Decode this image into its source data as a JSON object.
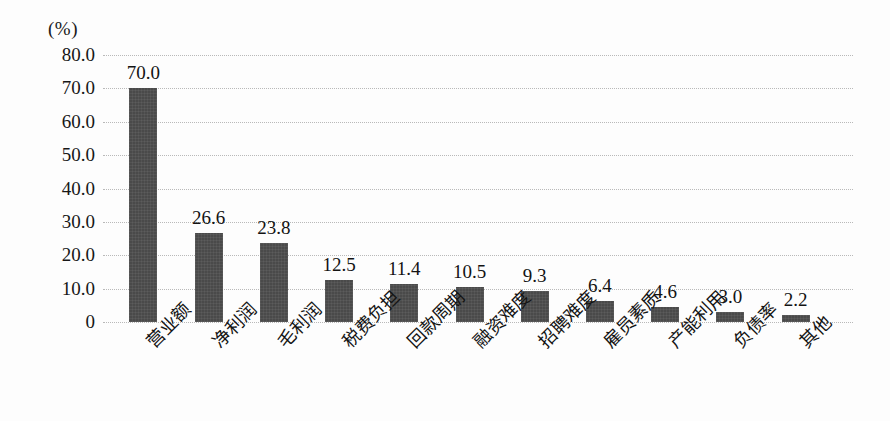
{
  "chart_data": {
    "type": "bar",
    "title": "",
    "subtitle": "",
    "xlabel": "",
    "ylabel": "",
    "unit_label": "(%)",
    "categories": [
      "营业额",
      "净利润",
      "毛利润",
      "税费负担",
      "回款周期",
      "融资难度",
      "招聘难度",
      "雇员素质",
      "产能利用",
      "负债率",
      "其他"
    ],
    "values": [
      70.0,
      26.6,
      23.8,
      12.5,
      11.4,
      10.5,
      9.3,
      6.4,
      4.6,
      3.0,
      2.2
    ],
    "value_labels": [
      "70.0",
      "26.6",
      "23.8",
      "12.5",
      "11.4",
      "10.5",
      "9.3",
      "6.4",
      "4.6",
      "3.0",
      "2.2"
    ],
    "ylim": [
      0,
      80
    ],
    "ytick_values": [
      80,
      70,
      60,
      50,
      40,
      30,
      20,
      10,
      0
    ],
    "ytick_labels": [
      "80.0",
      "70.0",
      "60.0",
      "50.0",
      "40.0",
      "30.0",
      "20.0",
      "10.0",
      "0"
    ],
    "grid": "horizontal-dotted",
    "legend": "none",
    "bar_color": "#4a4a4a",
    "grid_color": "#b9b9b9",
    "background_color": "#fdfdfd",
    "text_color": "#141414",
    "xlabel_rotation": -45
  }
}
